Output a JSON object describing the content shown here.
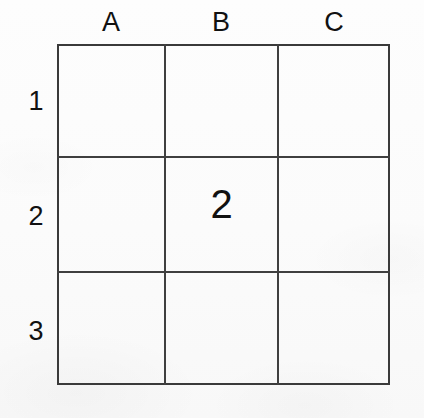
{
  "figure": {
    "type": "grid-table",
    "background_color": "#fcfcfc",
    "line_color": "#3f3f3f",
    "text_color": "#111111"
  },
  "columns": [
    {
      "key": "A",
      "label": "A"
    },
    {
      "key": "B",
      "label": "B"
    },
    {
      "key": "C",
      "label": "C"
    }
  ],
  "rows": [
    {
      "key": "1",
      "label": "1"
    },
    {
      "key": "2",
      "label": "2"
    },
    {
      "key": "3",
      "label": "3"
    }
  ],
  "cells": {
    "a1": "",
    "b1": "",
    "c1": "",
    "a2": "",
    "b2": "2",
    "c2": "",
    "a3": "",
    "b3": "",
    "c3": ""
  },
  "chart_data": {
    "type": "table",
    "title": "",
    "xlabel": "",
    "ylabel": "",
    "column_headers": [
      "A",
      "B",
      "C"
    ],
    "row_headers": [
      "1",
      "2",
      "3"
    ],
    "values": [
      [
        "",
        "",
        ""
      ],
      [
        "",
        "2",
        ""
      ],
      [
        "",
        "",
        ""
      ]
    ],
    "grid": true,
    "legend": "none"
  }
}
